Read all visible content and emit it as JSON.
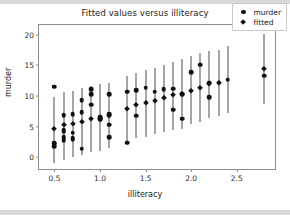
{
  "figure": {
    "title": "Fitted values versus illiteracy",
    "background_color": "#ffffff",
    "marker_color": "#111111",
    "errorbar_color": "#4d4d4d",
    "axes_color": "#8c8c8c"
  },
  "legend": {
    "position": "upper right",
    "entries": [
      {
        "label": "murder",
        "marker": "circle-marker-icon"
      },
      {
        "label": "fitted",
        "marker": "diamond-marker-icon"
      }
    ]
  },
  "chart_data": {
    "type": "scatter",
    "title": "Fitted values versus illiteracy",
    "xlabel": "illiteracy",
    "ylabel": "murder",
    "xlim": [
      0.33,
      2.92
    ],
    "ylim": [
      -1.9,
      21.6
    ],
    "grid": false,
    "legend_position": "upper right",
    "xticks": [
      0.5,
      1.0,
      1.5,
      2.0,
      2.5
    ],
    "xtick_labels": [
      "0.5",
      "1.0",
      "1.5",
      "2.0",
      "2.5"
    ],
    "yticks": [
      0,
      5,
      10,
      15,
      20
    ],
    "ytick_labels": [
      "0",
      "5",
      "10",
      "15",
      "20"
    ],
    "series": [
      {
        "name": "murder",
        "marker": "circle",
        "points": [
          {
            "x": 0.5,
            "y": 11.5
          },
          {
            "x": 0.5,
            "y": 2.3
          },
          {
            "x": 0.5,
            "y": 1.8
          },
          {
            "x": 0.6,
            "y": 6.9
          },
          {
            "x": 0.6,
            "y": 4.4
          },
          {
            "x": 0.6,
            "y": 4.2
          },
          {
            "x": 0.6,
            "y": 3.3
          },
          {
            "x": 0.6,
            "y": 2.8
          },
          {
            "x": 0.7,
            "y": 7.0
          },
          {
            "x": 0.7,
            "y": 4.0
          },
          {
            "x": 0.7,
            "y": 3.1
          },
          {
            "x": 0.7,
            "y": 2.9
          },
          {
            "x": 0.8,
            "y": 9.3
          },
          {
            "x": 0.8,
            "y": 7.4
          },
          {
            "x": 0.8,
            "y": 1.4
          },
          {
            "x": 0.9,
            "y": 11.1
          },
          {
            "x": 0.9,
            "y": 10.3
          },
          {
            "x": 0.9,
            "y": 8.6
          },
          {
            "x": 1.0,
            "y": 6.6
          },
          {
            "x": 1.0,
            "y": 6.2
          },
          {
            "x": 1.1,
            "y": 10.3
          },
          {
            "x": 1.1,
            "y": 7.0
          },
          {
            "x": 1.1,
            "y": 5.3
          },
          {
            "x": 1.1,
            "y": 3.3
          },
          {
            "x": 1.3,
            "y": 10.7
          },
          {
            "x": 1.3,
            "y": 2.4
          },
          {
            "x": 1.4,
            "y": 11.0
          },
          {
            "x": 1.4,
            "y": 6.8
          },
          {
            "x": 1.5,
            "y": 11.4
          },
          {
            "x": 1.6,
            "y": 10.7
          },
          {
            "x": 1.7,
            "y": 11.1
          },
          {
            "x": 1.8,
            "y": 11.2
          },
          {
            "x": 1.8,
            "y": 7.8
          },
          {
            "x": 1.9,
            "y": 10.3
          },
          {
            "x": 1.9,
            "y": 6.3
          },
          {
            "x": 2.0,
            "y": 13.9
          },
          {
            "x": 2.1,
            "y": 15.1
          },
          {
            "x": 2.2,
            "y": 12.2
          },
          {
            "x": 2.2,
            "y": 9.8
          },
          {
            "x": 2.3,
            "y": 12.2
          },
          {
            "x": 2.4,
            "y": 12.7
          },
          {
            "x": 2.8,
            "y": 13.3
          }
        ]
      },
      {
        "name": "fitted",
        "marker": "diamond",
        "points": [
          {
            "x": 0.5,
            "y": 4.6
          },
          {
            "x": 0.6,
            "y": 5.2
          },
          {
            "x": 0.7,
            "y": 5.4
          },
          {
            "x": 0.8,
            "y": 5.8
          },
          {
            "x": 0.9,
            "y": 6.2
          },
          {
            "x": 1.0,
            "y": 6.3
          },
          {
            "x": 1.1,
            "y": 6.8
          },
          {
            "x": 1.3,
            "y": 7.9
          },
          {
            "x": 1.4,
            "y": 8.5
          },
          {
            "x": 1.5,
            "y": 8.8
          },
          {
            "x": 1.6,
            "y": 9.2
          },
          {
            "x": 1.7,
            "y": 9.7
          },
          {
            "x": 1.8,
            "y": 10.1
          },
          {
            "x": 1.9,
            "y": 10.3
          },
          {
            "x": 2.0,
            "y": 10.9
          },
          {
            "x": 2.1,
            "y": 11.4
          },
          {
            "x": 2.2,
            "y": 11.9
          },
          {
            "x": 2.3,
            "y": 12.1
          },
          {
            "x": 2.8,
            "y": 14.4
          }
        ]
      }
    ],
    "errorbars": [
      {
        "x": 0.5,
        "low": -0.9,
        "high": 9.9
      },
      {
        "x": 0.6,
        "low": -0.4,
        "high": 10.6
      },
      {
        "x": 0.7,
        "low": 0.1,
        "high": 10.9
      },
      {
        "x": 0.8,
        "low": 0.4,
        "high": 11.3
      },
      {
        "x": 0.9,
        "low": 0.9,
        "high": 11.6
      },
      {
        "x": 1.0,
        "low": 1.1,
        "high": 11.9
      },
      {
        "x": 1.1,
        "low": 1.5,
        "high": 12.1
      },
      {
        "x": 1.3,
        "low": 2.6,
        "high": 13.2
      },
      {
        "x": 1.4,
        "low": 3.1,
        "high": 13.8
      },
      {
        "x": 1.5,
        "low": 3.4,
        "high": 14.2
      },
      {
        "x": 1.6,
        "low": 3.8,
        "high": 14.6
      },
      {
        "x": 1.7,
        "low": 4.2,
        "high": 15.0
      },
      {
        "x": 1.8,
        "low": 4.5,
        "high": 15.5
      },
      {
        "x": 1.9,
        "low": 4.7,
        "high": 16.0
      },
      {
        "x": 2.0,
        "low": 5.5,
        "high": 16.5
      },
      {
        "x": 2.1,
        "low": 5.8,
        "high": 17.0
      },
      {
        "x": 2.2,
        "low": 6.4,
        "high": 17.4
      },
      {
        "x": 2.3,
        "low": 6.8,
        "high": 17.6
      },
      {
        "x": 2.4,
        "low": 7.2,
        "high": 18.1
      },
      {
        "x": 2.8,
        "low": 8.7,
        "high": 20.2
      }
    ]
  }
}
